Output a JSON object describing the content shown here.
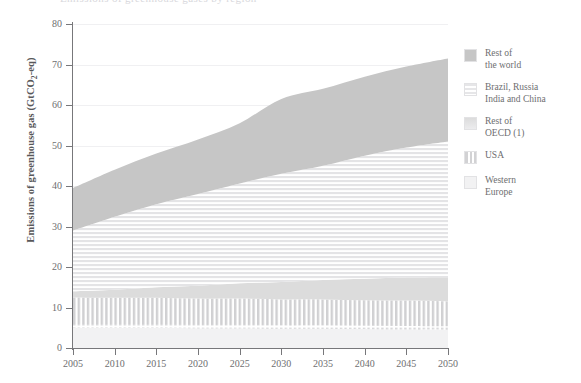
{
  "figure": {
    "title_sliver": "Emissions of greenhouse gases by region",
    "background": "#ffffff"
  },
  "axes": {
    "ylabel_pre": "Emissions of greenhouse gas (GtCO",
    "ylabel_sub": "2",
    "ylabel_post": "-eq)",
    "y_ticks": [
      "0",
      "10",
      "20",
      "30",
      "40",
      "50",
      "60",
      "70",
      "80"
    ],
    "x_ticks": [
      "2005",
      "2010",
      "2015",
      "2020",
      "2025",
      "2030",
      "2035",
      "2040",
      "2045",
      "2050"
    ]
  },
  "legend": {
    "position": "right",
    "items": [
      {
        "label": "Rest of\nthe world",
        "pattern": "solid-dark",
        "color": "#c6c6c6"
      },
      {
        "label": "Brazil, Russia\nIndia and China",
        "pattern": "horizontal",
        "color": "#e6e6e8"
      },
      {
        "label": "Rest of\nOECD (1)",
        "pattern": "solid-light",
        "color": "#dcdcdc"
      },
      {
        "label": "USA",
        "pattern": "vertical",
        "color": "#d2d2d4"
      },
      {
        "label": "Western\nEurope",
        "pattern": "solid-pale",
        "color": "#f2f2f3"
      }
    ]
  },
  "chart_data": {
    "type": "area",
    "stacked": true,
    "title": "Emissions of greenhouse gases by region",
    "xlabel": "",
    "ylabel": "Emissions of greenhouse gas (GtCO2-eq)",
    "xlim": [
      2005,
      2050
    ],
    "ylim": [
      0,
      80
    ],
    "grid": true,
    "legend_position": "right",
    "x": [
      2005,
      2010,
      2015,
      2020,
      2025,
      2030,
      2035,
      2040,
      2045,
      2050
    ],
    "series": [
      {
        "name": "Western Europe",
        "pattern": "solid-pale",
        "color": "#f2f2f3",
        "values": [
          5.0,
          5.0,
          5.0,
          4.9,
          4.9,
          4.8,
          4.8,
          4.7,
          4.6,
          4.5
        ],
        "cumulative_top": [
          5.0,
          5.0,
          5.0,
          4.9,
          4.9,
          4.8,
          4.8,
          4.7,
          4.6,
          4.5
        ]
      },
      {
        "name": "USA",
        "pattern": "vertical",
        "color": "#d2d2d4",
        "values": [
          7.5,
          7.4,
          7.4,
          7.3,
          7.3,
          7.2,
          7.2,
          7.1,
          7.1,
          7.0
        ],
        "cumulative_top": [
          12.5,
          12.4,
          12.4,
          12.2,
          12.2,
          12.0,
          12.0,
          11.8,
          11.7,
          11.5
        ]
      },
      {
        "name": "Rest of OECD (1)",
        "pattern": "solid-light",
        "color": "#dcdcdc",
        "values": [
          1.5,
          2.0,
          2.6,
          3.2,
          3.8,
          4.3,
          4.8,
          5.3,
          5.7,
          6.0
        ],
        "cumulative_top": [
          14.0,
          14.4,
          15.0,
          15.4,
          16.0,
          16.3,
          16.8,
          17.1,
          17.4,
          17.5
        ]
      },
      {
        "name": "Brazil, Russia India and China",
        "pattern": "horizontal",
        "color": "#e6e6e8",
        "values": [
          15.0,
          18.0,
          20.5,
          22.6,
          24.6,
          26.7,
          28.2,
          30.4,
          32.1,
          33.5
        ],
        "cumulative_top": [
          29.0,
          32.4,
          35.5,
          38.0,
          40.6,
          43.0,
          45.0,
          47.5,
          49.5,
          51.0
        ]
      },
      {
        "name": "Rest of the world",
        "pattern": "solid-dark",
        "color": "#c6c6c6",
        "values": [
          10.5,
          11.6,
          12.5,
          13.5,
          14.9,
          18.5,
          19.0,
          19.5,
          20.0,
          20.5
        ],
        "cumulative_top": [
          39.5,
          44.0,
          48.0,
          51.5,
          55.5,
          61.5,
          64.0,
          67.0,
          69.5,
          71.5
        ]
      }
    ],
    "total": [
      39.5,
      44.0,
      48.0,
      51.5,
      55.5,
      61.5,
      64.0,
      67.0,
      69.5,
      71.5
    ]
  }
}
